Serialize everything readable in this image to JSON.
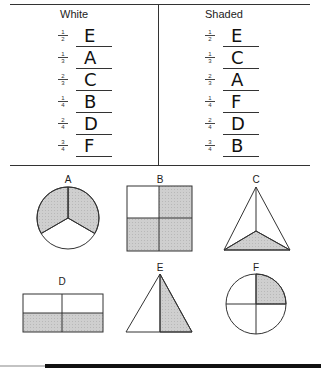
{
  "worksheet": {
    "columns": [
      {
        "title": "White",
        "rows": [
          {
            "num": "1",
            "den": "2",
            "answer": "E"
          },
          {
            "num": "1",
            "den": "3",
            "answer": "A"
          },
          {
            "num": "2",
            "den": "3",
            "answer": "C"
          },
          {
            "num": "1",
            "den": "4",
            "answer": "B"
          },
          {
            "num": "2",
            "den": "4",
            "answer": "D"
          },
          {
            "num": "3",
            "den": "4",
            "answer": "F"
          }
        ]
      },
      {
        "title": "Shaded",
        "rows": [
          {
            "num": "1",
            "den": "2",
            "answer": "E"
          },
          {
            "num": "1",
            "den": "3",
            "answer": "C"
          },
          {
            "num": "2",
            "den": "3",
            "answer": "A"
          },
          {
            "num": "1",
            "den": "4",
            "answer": "F"
          },
          {
            "num": "2",
            "den": "4",
            "answer": "D"
          },
          {
            "num": "3",
            "den": "4",
            "answer": "B"
          }
        ]
      }
    ],
    "shapes": [
      {
        "label": "A",
        "type": "circle-thirds",
        "shaded": "2/3"
      },
      {
        "label": "B",
        "type": "square-quarters",
        "shaded": "3/4"
      },
      {
        "label": "C",
        "type": "triangle-thirds",
        "shaded": "1/3"
      },
      {
        "label": "D",
        "type": "rectangle-quarters",
        "shaded": "2/4"
      },
      {
        "label": "E",
        "type": "triangle-halves",
        "shaded": "1/2"
      },
      {
        "label": "F",
        "type": "circle-quarters",
        "shaded": "1/4"
      }
    ],
    "colors": {
      "line": "#333333",
      "shade": "#c8c8c8",
      "background": "#ffffff"
    }
  }
}
